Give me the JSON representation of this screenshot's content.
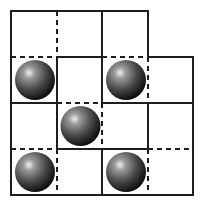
{
  "puzzle": {
    "type": "grid-pieces",
    "grid": {
      "cols": 4,
      "rows": 4,
      "x": [
        11,
        57,
        102,
        148,
        193
      ],
      "y": [
        11,
        57,
        103,
        149,
        195
      ]
    },
    "cells": [
      [
        0,
        0
      ],
      [
        0,
        1
      ],
      [
        0,
        2
      ],
      [
        1,
        0
      ],
      [
        1,
        1
      ],
      [
        1,
        2
      ],
      [
        1,
        3
      ],
      [
        2,
        0
      ],
      [
        2,
        1
      ],
      [
        2,
        2
      ],
      [
        2,
        3
      ],
      [
        3,
        0
      ],
      [
        3,
        1
      ],
      [
        3,
        2
      ],
      [
        3,
        3
      ]
    ],
    "balls": [
      {
        "row": 1,
        "col": 0
      },
      {
        "row": 1,
        "col": 2
      },
      {
        "row": 2,
        "col": 1
      },
      {
        "row": 3,
        "col": 0
      },
      {
        "row": 3,
        "col": 2
      }
    ],
    "horizontal_edges": [
      {
        "line": 0,
        "col": 0,
        "style": "solid"
      },
      {
        "line": 0,
        "col": 1,
        "style": "solid"
      },
      {
        "line": 0,
        "col": 2,
        "style": "solid"
      },
      {
        "line": 1,
        "col": 0,
        "style": "dashed"
      },
      {
        "line": 1,
        "col": 1,
        "style": "solid"
      },
      {
        "line": 1,
        "col": 2,
        "style": "dashed"
      },
      {
        "line": 1,
        "col": 3,
        "style": "solid"
      },
      {
        "line": 2,
        "col": 0,
        "style": "solid"
      },
      {
        "line": 2,
        "col": 1,
        "style": "dashed"
      },
      {
        "line": 2,
        "col": 2,
        "style": "solid"
      },
      {
        "line": 2,
        "col": 3,
        "style": "solid"
      },
      {
        "line": 3,
        "col": 0,
        "style": "dashed"
      },
      {
        "line": 3,
        "col": 1,
        "style": "solid"
      },
      {
        "line": 3,
        "col": 2,
        "style": "solid"
      },
      {
        "line": 3,
        "col": 3,
        "style": "dashed"
      },
      {
        "line": 4,
        "col": 0,
        "style": "solid"
      },
      {
        "line": 4,
        "col": 1,
        "style": "solid"
      },
      {
        "line": 4,
        "col": 2,
        "style": "solid"
      },
      {
        "line": 4,
        "col": 3,
        "style": "solid"
      }
    ],
    "vertical_edges": [
      {
        "line": 0,
        "row": 0,
        "style": "solid"
      },
      {
        "line": 1,
        "row": 0,
        "style": "dashed"
      },
      {
        "line": 2,
        "row": 0,
        "style": "solid"
      },
      {
        "line": 3,
        "row": 0,
        "style": "solid"
      },
      {
        "line": 0,
        "row": 1,
        "style": "solid"
      },
      {
        "line": 1,
        "row": 1,
        "style": "solid"
      },
      {
        "line": 2,
        "row": 1,
        "style": "solid"
      },
      {
        "line": 3,
        "row": 1,
        "style": "dashed"
      },
      {
        "line": 4,
        "row": 1,
        "style": "solid"
      },
      {
        "line": 0,
        "row": 2,
        "style": "solid"
      },
      {
        "line": 1,
        "row": 2,
        "style": "solid"
      },
      {
        "line": 2,
        "row": 2,
        "style": "dashed"
      },
      {
        "line": 3,
        "row": 2,
        "style": "solid"
      },
      {
        "line": 4,
        "row": 2,
        "style": "solid"
      },
      {
        "line": 0,
        "row": 3,
        "style": "solid"
      },
      {
        "line": 1,
        "row": 3,
        "style": "dashed"
      },
      {
        "line": 2,
        "row": 3,
        "style": "solid"
      },
      {
        "line": 3,
        "row": 3,
        "style": "dashed"
      },
      {
        "line": 4,
        "row": 3,
        "style": "solid"
      }
    ],
    "colors": {
      "line": "#1e1e1e",
      "ball_highlight": "#e8e8e8",
      "ball_mid": "#6a6a6a",
      "ball_dark": "#141414"
    }
  }
}
